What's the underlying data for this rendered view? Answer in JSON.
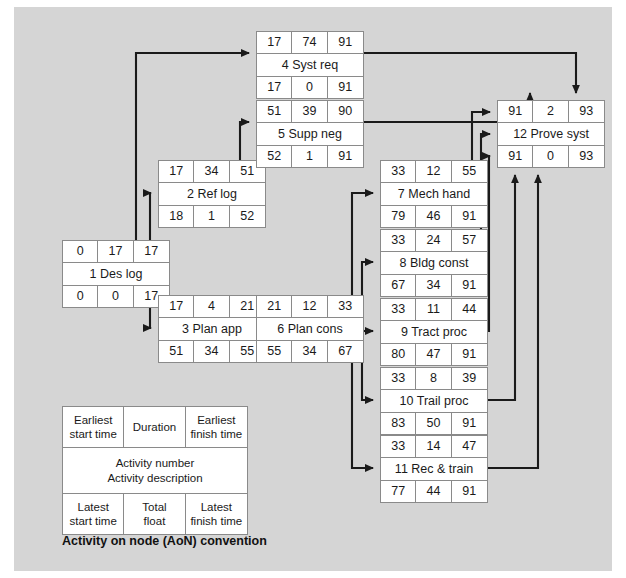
{
  "diagram": {
    "caption": "Activity on node (AoN) convention",
    "canvas_background": "#d5d5d5",
    "node_fill": "#ffffff",
    "node_border": "#8a8a8a",
    "edge_color": "#1a1a1a"
  },
  "legend": {
    "earliest_start": "Earliest\nstart time",
    "earliest_start_l1": "Earliest",
    "earliest_start_l2": "start time",
    "duration": "Duration",
    "earliest_finish_l1": "Earliest",
    "earliest_finish_l2": "finish time",
    "middle_l1": "Activity number",
    "middle_l2": "Activity description",
    "latest_start_l1": "Latest",
    "latest_start_l2": "start time",
    "total_float_l1": "Total",
    "total_float_l2": "float",
    "latest_finish_l1": "Latest",
    "latest_finish_l2": "finish time"
  },
  "nodes": [
    {
      "id": 1,
      "name": "node-1-des-log",
      "earliest_start": "0",
      "duration": "17",
      "earliest_finish": "17",
      "description": "1 Des log",
      "latest_start": "0",
      "total_float": "0",
      "latest_finish": "17",
      "x": 62,
      "y": 240
    },
    {
      "id": 2,
      "name": "node-2-ref-log",
      "earliest_start": "17",
      "duration": "34",
      "earliest_finish": "51",
      "description": "2 Ref log",
      "latest_start": "18",
      "total_float": "1",
      "latest_finish": "52",
      "x": 158,
      "y": 160
    },
    {
      "id": 3,
      "name": "node-3-plan-app",
      "earliest_start": "17",
      "duration": "4",
      "earliest_finish": "21",
      "description": "3 Plan app",
      "latest_start": "51",
      "total_float": "34",
      "latest_finish": "55",
      "x": 158,
      "y": 295
    },
    {
      "id": 4,
      "name": "node-4-syst-req",
      "earliest_start": "17",
      "duration": "74",
      "earliest_finish": "91",
      "description": "4 Syst req",
      "latest_start": "17",
      "total_float": "0",
      "latest_finish": "91",
      "x": 256,
      "y": 31
    },
    {
      "id": 5,
      "name": "node-5-supp-neg",
      "earliest_start": "51",
      "duration": "39",
      "earliest_finish": "90",
      "description": "5 Supp neg",
      "latest_start": "52",
      "total_float": "1",
      "latest_finish": "91",
      "x": 256,
      "y": 100
    },
    {
      "id": 6,
      "name": "node-6-plan-cons",
      "earliest_start": "21",
      "duration": "12",
      "earliest_finish": "33",
      "description": "6 Plan cons",
      "latest_start": "55",
      "total_float": "34",
      "latest_finish": "67",
      "x": 256,
      "y": 295
    },
    {
      "id": 7,
      "name": "node-7-mech-hand",
      "earliest_start": "33",
      "duration": "12",
      "earliest_finish": "55",
      "description": "7 Mech hand",
      "latest_start": "79",
      "total_float": "46",
      "latest_finish": "91",
      "x": 380,
      "y": 160
    },
    {
      "id": 8,
      "name": "node-8-bldg-const",
      "earliest_start": "33",
      "duration": "24",
      "earliest_finish": "57",
      "description": "8 Bldg const",
      "latest_start": "67",
      "total_float": "34",
      "latest_finish": "91",
      "x": 380,
      "y": 229
    },
    {
      "id": 9,
      "name": "node-9-tract-proc",
      "earliest_start": "33",
      "duration": "11",
      "earliest_finish": "44",
      "description": "9 Tract proc",
      "latest_start": "80",
      "total_float": "47",
      "latest_finish": "91",
      "x": 380,
      "y": 298
    },
    {
      "id": 10,
      "name": "node-10-trail-proc",
      "earliest_start": "33",
      "duration": "8",
      "earliest_finish": "39",
      "description": "10 Trail proc",
      "latest_start": "83",
      "total_float": "50",
      "latest_finish": "91",
      "x": 380,
      "y": 367
    },
    {
      "id": 11,
      "name": "node-11-rec-train",
      "earliest_start": "33",
      "duration": "14",
      "earliest_finish": "47",
      "description": "11 Rec & train",
      "latest_start": "77",
      "total_float": "44",
      "latest_finish": "91",
      "x": 380,
      "y": 435
    },
    {
      "id": 12,
      "name": "node-12-prove-syst",
      "earliest_start": "91",
      "duration": "2",
      "earliest_finish": "93",
      "description": "12 Prove syst",
      "latest_start": "91",
      "total_float": "0",
      "latest_finish": "93",
      "x": 497,
      "y": 100
    }
  ],
  "edges": [
    {
      "from": 1,
      "to": 4,
      "name": "edge-1-to-4"
    },
    {
      "from": 1,
      "to": 2,
      "name": "edge-1-to-2"
    },
    {
      "from": 1,
      "to": 3,
      "name": "edge-1-to-3"
    },
    {
      "from": 2,
      "to": 5,
      "name": "edge-2-to-5"
    },
    {
      "from": 3,
      "to": 6,
      "name": "edge-3-to-6"
    },
    {
      "from": 4,
      "to": 12,
      "name": "edge-4-to-12"
    },
    {
      "from": 5,
      "to": 12,
      "name": "edge-5-to-12"
    },
    {
      "from": 6,
      "to": 7,
      "name": "edge-6-to-7"
    },
    {
      "from": 6,
      "to": 8,
      "name": "edge-6-to-8"
    },
    {
      "from": 6,
      "to": 9,
      "name": "edge-6-to-9"
    },
    {
      "from": 6,
      "to": 10,
      "name": "edge-6-to-10"
    },
    {
      "from": 6,
      "to": 11,
      "name": "edge-6-to-11"
    },
    {
      "from": 7,
      "to": 12,
      "name": "edge-7-to-12"
    },
    {
      "from": 8,
      "to": 12,
      "name": "edge-8-to-12"
    },
    {
      "from": 9,
      "to": 12,
      "name": "edge-9-to-12"
    },
    {
      "from": 10,
      "to": 12,
      "name": "edge-10-to-12"
    },
    {
      "from": 11,
      "to": 12,
      "name": "edge-11-to-12"
    }
  ]
}
